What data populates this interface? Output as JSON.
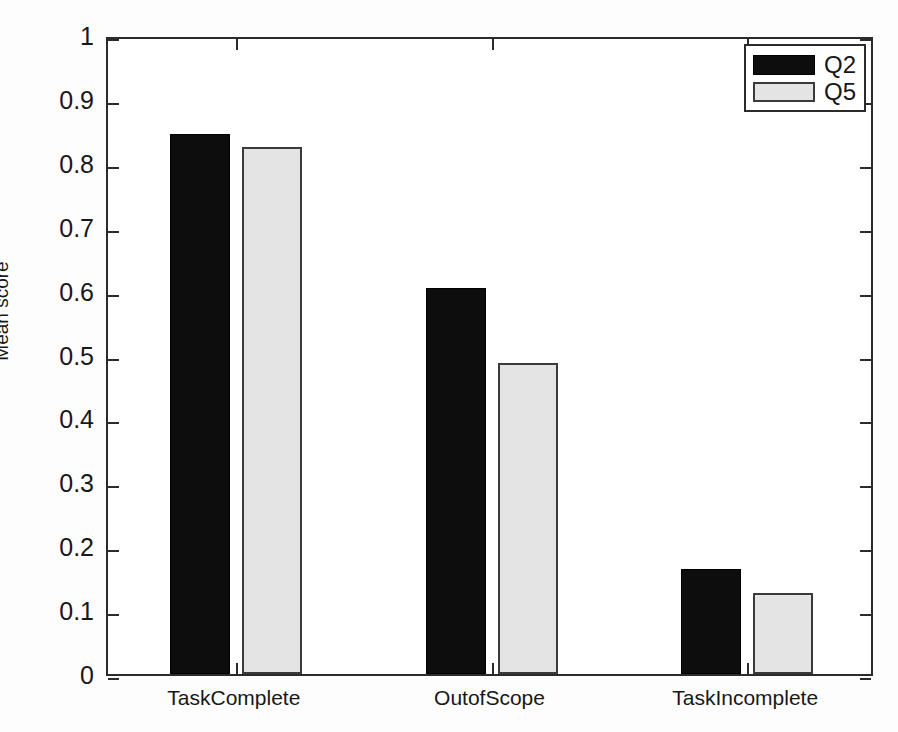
{
  "chart_data": {
    "type": "bar",
    "title": "",
    "subtitle": "",
    "xlabel": "",
    "ylabel": "Mean score",
    "categories": [
      "TaskComplete",
      "OutofScope",
      "TaskIncomplete"
    ],
    "series": [
      {
        "name": "Q2",
        "color": "#0d0d0d",
        "values": [
          0.845,
          0.604,
          0.164
        ]
      },
      {
        "name": "Q5",
        "color": "#e4e4e4",
        "values": [
          0.825,
          0.487,
          0.127
        ]
      }
    ],
    "ylim": [
      0,
      1
    ],
    "ytick_labels": [
      "0",
      "0.1",
      "0.2",
      "0.3",
      "0.4",
      "0.5",
      "0.6",
      "0.7",
      "0.8",
      "0.9",
      "1"
    ],
    "ytick_values": [
      0,
      0.1,
      0.2,
      0.3,
      0.4,
      0.5,
      0.6,
      0.7,
      0.8,
      0.9,
      1
    ],
    "grid": false,
    "legend_position": "top-right",
    "legend_entries": [
      "Q2",
      "Q5"
    ],
    "bar_group_mode": "grouped",
    "frame": "box",
    "tick_direction": "in"
  }
}
